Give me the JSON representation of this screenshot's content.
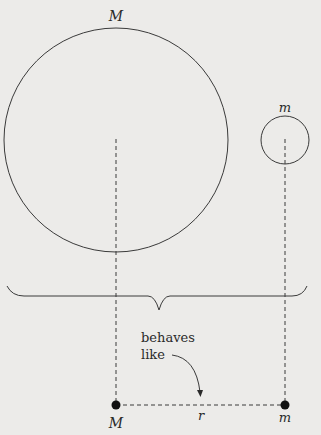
{
  "diagram": {
    "colors": {
      "background": "#ecebe9",
      "stroke": "#3a3a3a",
      "text": "#2a2a2a"
    },
    "large_body": {
      "label": "M",
      "center": [
        116,
        140
      ],
      "radius": 112
    },
    "small_body": {
      "label": "m",
      "center": [
        285,
        140
      ],
      "radius": 24
    },
    "brace": {
      "from_x": 7,
      "to_x": 307,
      "y": 296,
      "tip": [
        159,
        310
      ]
    },
    "annotation": {
      "line1": "behaves",
      "line2": "like"
    },
    "point_masses": {
      "left": {
        "label": "M",
        "position": [
          116,
          405
        ]
      },
      "right": {
        "label": "m",
        "position": [
          285,
          405
        ]
      }
    },
    "separation_label": "r"
  }
}
